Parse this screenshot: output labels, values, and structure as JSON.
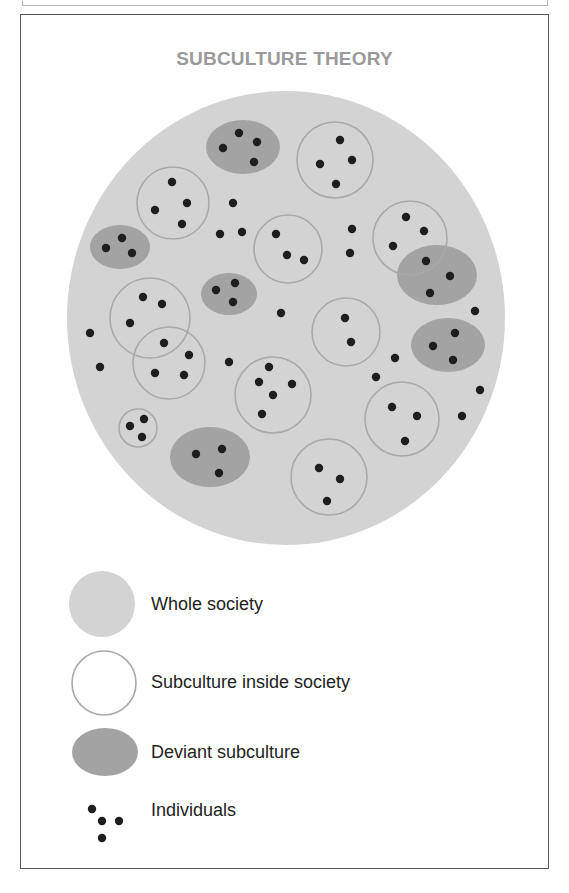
{
  "title": "SUBCULTURE THEORY",
  "colors": {
    "society_fill": "#d3d3d3",
    "subculture_stroke": "#a9a9a9",
    "deviant_fill": "#a3a3a3",
    "individual_fill": "#1e1e1e",
    "title_color": "#9a9a9a",
    "frame_color": "#555555"
  },
  "society": {
    "cx": 286,
    "cy": 318,
    "rx": 219,
    "ry": 227
  },
  "subcultures": [
    {
      "id": "S1",
      "cx": 335,
      "cy": 160,
      "r": 38,
      "dots": [
        [
          340,
          140
        ],
        [
          320,
          164
        ],
        [
          352,
          160
        ],
        [
          336,
          184
        ]
      ]
    },
    {
      "id": "S2",
      "cx": 173,
      "cy": 203,
      "r": 36,
      "dots": [
        [
          172,
          182
        ],
        [
          155,
          210
        ],
        [
          187,
          203
        ],
        [
          182,
          224
        ]
      ]
    },
    {
      "id": "S3",
      "cx": 288,
      "cy": 249,
      "r": 34,
      "dots": [
        [
          276,
          234
        ],
        [
          287,
          255
        ],
        [
          304,
          260
        ]
      ]
    },
    {
      "id": "S4",
      "cx": 410,
      "cy": 238,
      "r": 37,
      "dots": [
        [
          406,
          217
        ],
        [
          424,
          231
        ],
        [
          393,
          246
        ],
        [
          426,
          261
        ]
      ]
    },
    {
      "id": "S5",
      "cx": 150,
      "cy": 318,
      "r": 40,
      "dots": [
        [
          143,
          297
        ],
        [
          162,
          304
        ],
        [
          130,
          323
        ],
        [
          164,
          343
        ]
      ]
    },
    {
      "id": "S6",
      "cx": 169,
      "cy": 363,
      "r": 36,
      "dots": [
        [
          189,
          355
        ],
        [
          155,
          373
        ],
        [
          184,
          375
        ]
      ]
    },
    {
      "id": "S7",
      "cx": 346,
      "cy": 332,
      "r": 34,
      "dots": [
        [
          345,
          318
        ],
        [
          351,
          342
        ]
      ]
    },
    {
      "id": "S8",
      "cx": 273,
      "cy": 395,
      "r": 38,
      "dots": [
        [
          269,
          367
        ],
        [
          259,
          382
        ],
        [
          292,
          384
        ],
        [
          273,
          395
        ],
        [
          262,
          414
        ]
      ]
    },
    {
      "id": "S9",
      "cx": 402,
      "cy": 419,
      "r": 37,
      "dots": [
        [
          392,
          407
        ],
        [
          417,
          416
        ],
        [
          405,
          441
        ]
      ]
    },
    {
      "id": "S10",
      "cx": 138,
      "cy": 428,
      "r": 19,
      "dots": [
        [
          144,
          419
        ],
        [
          130,
          426
        ],
        [
          142,
          437
        ]
      ]
    },
    {
      "id": "S11",
      "cx": 329,
      "cy": 477,
      "r": 38,
      "dots": [
        [
          319,
          468
        ],
        [
          340,
          479
        ],
        [
          327,
          501
        ]
      ]
    }
  ],
  "deviant_subcultures": [
    {
      "id": "D1",
      "cx": 243,
      "cy": 147,
      "rx": 37,
      "ry": 27,
      "dots": [
        [
          239,
          133
        ],
        [
          223,
          148
        ],
        [
          257,
          142
        ],
        [
          254,
          162
        ]
      ]
    },
    {
      "id": "D2",
      "cx": 120,
      "cy": 247,
      "rx": 30,
      "ry": 22,
      "dots": [
        [
          122,
          238
        ],
        [
          106,
          248
        ],
        [
          132,
          253
        ]
      ]
    },
    {
      "id": "D3",
      "cx": 229,
      "cy": 294,
      "rx": 28,
      "ry": 21,
      "dots": [
        [
          216,
          290
        ],
        [
          235,
          283
        ],
        [
          233,
          302
        ]
      ]
    },
    {
      "id": "D4",
      "cx": 437,
      "cy": 275,
      "rx": 40,
      "ry": 30,
      "dots": [
        [
          450,
          276
        ],
        [
          430,
          293
        ]
      ]
    },
    {
      "id": "D5",
      "cx": 448,
      "cy": 345,
      "rx": 37,
      "ry": 27,
      "dots": [
        [
          455,
          333
        ],
        [
          433,
          346
        ],
        [
          453,
          360
        ]
      ]
    },
    {
      "id": "D6",
      "cx": 210,
      "cy": 457,
      "rx": 40,
      "ry": 30,
      "dots": [
        [
          196,
          454
        ],
        [
          222,
          449
        ],
        [
          219,
          473
        ]
      ]
    }
  ],
  "free_individuals": [
    [
      233,
      203
    ],
    [
      220,
      234
    ],
    [
      242,
      232
    ],
    [
      352,
      229
    ],
    [
      350,
      253
    ],
    [
      281,
      313
    ],
    [
      229,
      362
    ],
    [
      90,
      333
    ],
    [
      100,
      367
    ],
    [
      475,
      311
    ],
    [
      395,
      358
    ],
    [
      376,
      377
    ],
    [
      480,
      390
    ],
    [
      462,
      416
    ]
  ],
  "dot_radius": 4.2,
  "legend": {
    "items": [
      {
        "label": "Whole society",
        "shape": "filled-circle"
      },
      {
        "label": "Subculture inside society",
        "shape": "outline-circle"
      },
      {
        "label": "Deviant subculture",
        "shape": "dark-ellipse"
      },
      {
        "label": "Individuals",
        "shape": "dots"
      }
    ],
    "dots": [
      [
        92,
        809
      ],
      [
        102,
        821
      ],
      [
        119,
        821
      ],
      [
        102,
        838
      ]
    ]
  }
}
